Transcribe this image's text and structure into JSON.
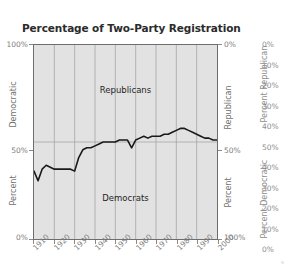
{
  "chart_data": {
    "type": "line",
    "title": "Percentage of Two-Party Registration",
    "xlabel": "",
    "ylabel": "Percent Democratic",
    "xlim": [
      1910,
      2000
    ],
    "ylim": [
      0,
      100
    ],
    "grid": true,
    "legend_position": "inline",
    "annotations": [
      {
        "text": "Republicans",
        "region": "upper"
      },
      {
        "text": "Democrats",
        "region": "lower"
      }
    ],
    "series": [
      {
        "name": "Percent Democratic",
        "x": [
          1910,
          1912,
          1914,
          1916,
          1918,
          1920,
          1922,
          1924,
          1926,
          1928,
          1930,
          1932,
          1934,
          1936,
          1938,
          1940,
          1942,
          1944,
          1946,
          1948,
          1950,
          1952,
          1954,
          1956,
          1958,
          1960,
          1962,
          1964,
          1966,
          1968,
          1970,
          1972,
          1974,
          1976,
          1978,
          1980,
          1982,
          1984,
          1986,
          1988,
          1990,
          1992,
          1994,
          1996,
          1998,
          2000
        ],
        "values": [
          35,
          30,
          36,
          38,
          37,
          36,
          36,
          36,
          36,
          36,
          35,
          42,
          46,
          47,
          47,
          48,
          49,
          50,
          50,
          50,
          50,
          51,
          51,
          51,
          47,
          51,
          52,
          53,
          52,
          53,
          53,
          53,
          54,
          54,
          55,
          56,
          57,
          57,
          56,
          55,
          54,
          53,
          52,
          52,
          51,
          51
        ]
      }
    ],
    "x_ticks": [
      "1910",
      "1920",
      "1930",
      "1940",
      "1950",
      "1960",
      "1970",
      "1980",
      "1990",
      "2000"
    ],
    "x_tick_values": [
      1910,
      1920,
      1930,
      1940,
      1950,
      1960,
      1970,
      1980,
      1990,
      2000
    ],
    "left_axis": {
      "title_line1": "Democratic",
      "title_line2": "Percent",
      "ticks": [
        "100%",
        "50%",
        "0%"
      ],
      "tick_values": [
        100,
        50,
        0
      ]
    },
    "right_axis": {
      "title_line1": "Republican",
      "title_line2": "Percent",
      "ticks": [
        "0%",
        "50%",
        "100%"
      ],
      "tick_values": [
        0,
        50,
        100
      ]
    }
  },
  "outer_axis": {
    "republican": {
      "title": "Percent Republican",
      "ticks": [
        "0%",
        "10%",
        "20%",
        "30%",
        "40%",
        "50%"
      ]
    },
    "democratic": {
      "title": "Percent Democratic",
      "ticks": [
        "40%",
        "30%",
        "20%",
        "10%",
        "0%"
      ]
    }
  }
}
